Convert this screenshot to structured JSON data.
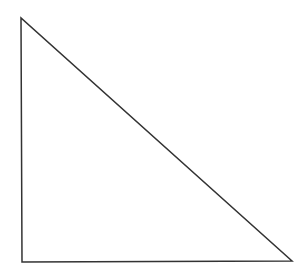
{
  "diagram": {
    "shape": "right-triangle",
    "stroke_color": "#333333",
    "background": "#ffffff",
    "vertices": [
      [
        21,
        18
      ],
      [
        22,
        262
      ],
      [
        292,
        261
      ]
    ]
  }
}
